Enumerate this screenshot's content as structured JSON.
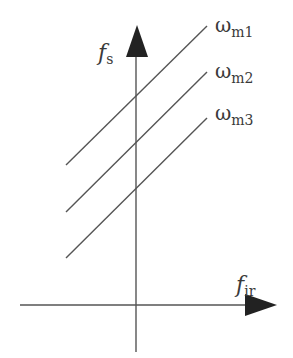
{
  "diagram": {
    "y_axis": {
      "label_main": "f",
      "label_sub": "s"
    },
    "x_axis": {
      "label_main": "f",
      "label_sub": "ir"
    },
    "lines": [
      {
        "label_main": "ω",
        "label_sub": "m1"
      },
      {
        "label_main": "ω",
        "label_sub": "m2"
      },
      {
        "label_main": "ω",
        "label_sub": "m3"
      }
    ],
    "colors": {
      "stroke": "#555555",
      "arrow": "#222222",
      "text": "#3a3a3a"
    }
  }
}
